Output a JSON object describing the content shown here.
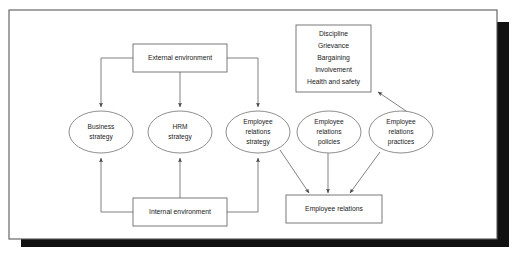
{
  "figure": {
    "frame": {
      "border_color": "#5a5a5a",
      "shadow_color": "#111111",
      "background_color": "#ffffff"
    },
    "line_color": "#6b6b6b",
    "text_color": "#1a1a1a"
  },
  "nodes": {
    "external_environment": {
      "label": "External environment",
      "shape": "rectangle"
    },
    "internal_environment": {
      "label": "Internal environment",
      "shape": "rectangle"
    },
    "business_strategy": {
      "line1": "Business",
      "line2": "strategy",
      "shape": "ellipse"
    },
    "hrm_strategy": {
      "line1": "HRM",
      "line2": "strategy",
      "shape": "ellipse"
    },
    "employee_relations_strategy": {
      "line1": "Employee",
      "line2": "relations",
      "line3": "strategy",
      "shape": "ellipse"
    },
    "employee_relations_policies": {
      "line1": "Employee",
      "line2": "relations",
      "line3": "policies",
      "shape": "ellipse"
    },
    "employee_relations_practices": {
      "line1": "Employee",
      "line2": "relations",
      "line3": "practices",
      "shape": "ellipse"
    },
    "employee_relations": {
      "label": "Employee relations",
      "shape": "rectangle"
    },
    "topics_box": {
      "shape": "rectangle",
      "items": [
        "Discipline",
        "Grievance",
        "Bargaining",
        "Involvement",
        "Health and safety"
      ]
    }
  },
  "edges": [
    {
      "from": "external_environment",
      "to": "business_strategy",
      "style": "elbow-arrow"
    },
    {
      "from": "external_environment",
      "to": "hrm_strategy",
      "style": "straight-arrow"
    },
    {
      "from": "external_environment",
      "to": "employee_relations_strategy",
      "style": "elbow-arrow"
    },
    {
      "from": "internal_environment",
      "to": "business_strategy",
      "style": "elbow-arrow"
    },
    {
      "from": "internal_environment",
      "to": "hrm_strategy",
      "style": "straight-arrow"
    },
    {
      "from": "internal_environment",
      "to": "employee_relations_strategy",
      "style": "elbow-arrow"
    },
    {
      "from": "employee_relations_strategy",
      "to": "employee_relations",
      "style": "diagonal-arrow"
    },
    {
      "from": "employee_relations_policies",
      "to": "employee_relations",
      "style": "straight-arrow"
    },
    {
      "from": "employee_relations_practices",
      "to": "employee_relations",
      "style": "diagonal-arrow"
    },
    {
      "from": "employee_relations_practices",
      "to": "topics_box",
      "style": "diagonal-arrow"
    }
  ]
}
